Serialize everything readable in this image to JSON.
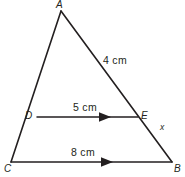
{
  "figure": {
    "type": "geometry-diagram",
    "shape": "triangle-with-parallel-midsegment",
    "background_color": "#ffffff",
    "stroke_color": "#231f20",
    "vertices": [
      {
        "id": "A",
        "label": "A",
        "x": 61,
        "y": 11
      },
      {
        "id": "B",
        "label": "B",
        "x": 172,
        "y": 162
      },
      {
        "id": "C",
        "label": "C",
        "x": 11,
        "y": 162
      },
      {
        "id": "D",
        "label": "D",
        "x": 37,
        "y": 117
      },
      {
        "id": "E",
        "label": "E",
        "x": 138,
        "y": 117
      }
    ],
    "segments": [
      {
        "id": "AC",
        "from": "A",
        "to": "C",
        "arrow": false
      },
      {
        "id": "AB",
        "from": "A",
        "to": "B",
        "arrow": false
      },
      {
        "id": "CB",
        "from": "C",
        "to": "B",
        "arrow": true
      },
      {
        "id": "DE",
        "from": "D",
        "to": "E",
        "arrow": true
      }
    ],
    "measurements": {
      "side_ab": "4 cm",
      "segment_de": "5 cm",
      "segment_cb": "8 cm",
      "segment_eb": "x"
    },
    "arrow_markers": [
      {
        "id": "arrow-de",
        "on": "DE",
        "tip_x": 111,
        "y": 117
      },
      {
        "id": "arrow-cb",
        "on": "CB",
        "tip_x": 113,
        "y": 162
      }
    ]
  }
}
